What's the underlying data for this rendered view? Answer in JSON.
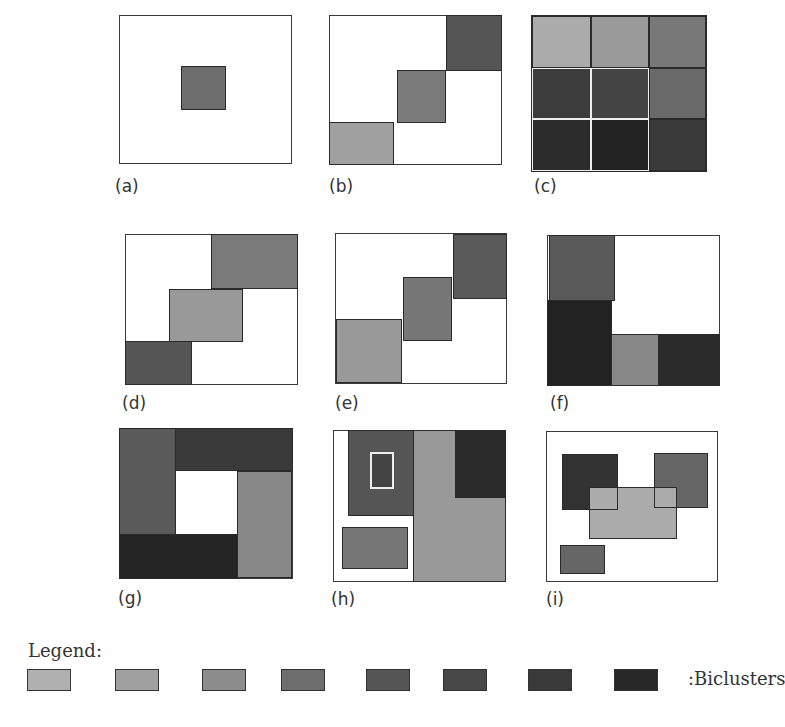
{
  "panels": {
    "a": {
      "label": "(a)",
      "description": "Single bicluster"
    },
    "b": {
      "label": "(b)",
      "description": "Exclusive row and column biclusters"
    },
    "c": {
      "label": "(c)",
      "description": "Checkerboard structure"
    },
    "d": {
      "label": "(d)",
      "description": "Exclusive rows biclusters"
    },
    "e": {
      "label": "(e)",
      "description": "Exclusive columns biclusters"
    },
    "f": {
      "label": "(f)",
      "description": "Nonoverlapping with tree structure"
    },
    "g": {
      "label": "(g)",
      "description": "Nonoverlapping nonexclusive biclusters"
    },
    "h": {
      "label": "(h)",
      "description": "Overlapping with hierarchical structure"
    },
    "i": {
      "label": "(i)",
      "description": "Arbitrarily positioned overlapping biclusters"
    }
  },
  "legend": {
    "title": "Legend:",
    "suffix": ":Biclusters",
    "swatches": [
      "#b0b0b0",
      "#a0a0a0",
      "#8c8c8c",
      "#6e6e6e",
      "#555555",
      "#484848",
      "#3a3a3a",
      "#282828"
    ]
  }
}
